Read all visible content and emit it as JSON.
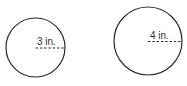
{
  "figures": [
    {
      "shape": "circle",
      "radius_label": "3 in.",
      "radius_value": 3,
      "unit": "in.",
      "stroke_color": "#2a2a2a"
    },
    {
      "shape": "circle",
      "radius_label": "4 in.",
      "radius_value": 4,
      "unit": "in.",
      "stroke_color": "#2a2a2a"
    }
  ]
}
